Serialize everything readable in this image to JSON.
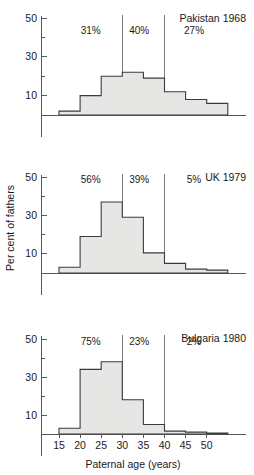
{
  "figure": {
    "ylabel": "Per cent of fathers",
    "xlabel": "Paternal age (years)",
    "x_ticks": [
      "15",
      "20",
      "25",
      "30",
      "35",
      "40",
      "45",
      "50"
    ],
    "y_ticks": [
      "10",
      "30",
      "50"
    ],
    "colors": {
      "bar_fill": "#e6e6e4",
      "bar_stroke": "#3b3b3d",
      "axis": "#58585a",
      "reference_line": "#6d6d70",
      "text": "#1a1a1a",
      "background": "#ffffff"
    }
  },
  "chart_data": [
    {
      "type": "bar",
      "title": "Pakistan 1968",
      "xlabel": "Paternal age (years)",
      "ylabel": "Per cent of fathers",
      "xlim": [
        12.5,
        57.5
      ],
      "ylim": [
        0,
        55
      ],
      "xticks": [
        15,
        20,
        25,
        30,
        35,
        40,
        45,
        50
      ],
      "yticks": [
        10,
        30,
        50
      ],
      "yticks_minor": [
        20,
        40
      ],
      "grid": false,
      "bin_edges": [
        15,
        20,
        25,
        30,
        35,
        40,
        45,
        50,
        55
      ],
      "categories": [
        "15-20",
        "20-25",
        "25-30",
        "30-35",
        "35-40",
        "40-45",
        "45-50",
        "50-55"
      ],
      "values": [
        2,
        10,
        20,
        22,
        19,
        12,
        8,
        6
      ],
      "reference_lines": [
        30,
        40
      ],
      "annotations": [
        {
          "text": "31%",
          "x": 22.5,
          "y": 42
        },
        {
          "text": "40%",
          "x": 34,
          "y": 42
        },
        {
          "text": "27%",
          "x": 47,
          "y": 42
        }
      ]
    },
    {
      "type": "bar",
      "title": "UK 1979",
      "xlabel": "Paternal age (years)",
      "ylabel": "Per cent of fathers",
      "xlim": [
        12.5,
        57.5
      ],
      "ylim": [
        0,
        55
      ],
      "xticks": [
        15,
        20,
        25,
        30,
        35,
        40,
        45,
        50
      ],
      "yticks": [
        10,
        30,
        50
      ],
      "yticks_minor": [
        20,
        40
      ],
      "grid": false,
      "bin_edges": [
        15,
        20,
        25,
        30,
        35,
        40,
        45,
        50,
        55
      ],
      "categories": [
        "15-20",
        "20-25",
        "25-30",
        "30-35",
        "35-40",
        "40-45",
        "45-50",
        "50-55"
      ],
      "values": [
        3,
        19,
        37,
        29,
        10.5,
        5,
        2,
        1.5
      ],
      "reference_lines": [
        30,
        40
      ],
      "annotations": [
        {
          "text": "56%",
          "x": 22.5,
          "y": 47
        },
        {
          "text": "39%",
          "x": 34,
          "y": 47
        },
        {
          "text": "5%",
          "x": 47,
          "y": 47
        }
      ]
    },
    {
      "type": "bar",
      "title": "Bulgaria 1980",
      "xlabel": "Paternal age (years)",
      "ylabel": "Per cent of fathers",
      "xlim": [
        12.5,
        57.5
      ],
      "ylim": [
        0,
        55
      ],
      "xticks": [
        15,
        20,
        25,
        30,
        35,
        40,
        45,
        50
      ],
      "yticks": [
        10,
        30,
        50
      ],
      "yticks_minor": [
        20,
        40
      ],
      "grid": false,
      "bin_edges": [
        15,
        20,
        25,
        30,
        35,
        40,
        45,
        50,
        55
      ],
      "categories": [
        "15-20",
        "20-25",
        "25-30",
        "30-35",
        "35-40",
        "40-45",
        "45-50",
        "50-55"
      ],
      "values": [
        3,
        34,
        38,
        18,
        5,
        1.5,
        1,
        0.5
      ],
      "reference_lines": [
        30,
        40
      ],
      "annotations": [
        {
          "text": "75%",
          "x": 22.5,
          "y": 47
        },
        {
          "text": "23%",
          "x": 34,
          "y": 47
        },
        {
          "text": "2%",
          "x": 47,
          "y": 47
        }
      ]
    }
  ]
}
